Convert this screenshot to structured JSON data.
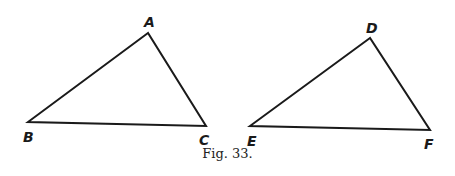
{
  "figure": {
    "caption": "Fig. 33.",
    "stroke_color": "#1a1a1a",
    "triangles": [
      {
        "name": "ABC",
        "vertices": [
          {
            "label": "A",
            "x": 148,
            "y": 33,
            "lx": 144,
            "ly": 27
          },
          {
            "label": "B",
            "x": 28,
            "y": 122,
            "lx": 23,
            "ly": 142
          },
          {
            "label": "C",
            "x": 206,
            "y": 126,
            "lx": 199,
            "ly": 145
          }
        ]
      },
      {
        "name": "DEF",
        "vertices": [
          {
            "label": "D",
            "x": 370,
            "y": 38,
            "lx": 366,
            "ly": 33
          },
          {
            "label": "E",
            "x": 250,
            "y": 126,
            "lx": 247,
            "ly": 146
          },
          {
            "label": "F",
            "x": 430,
            "y": 130,
            "lx": 424,
            "ly": 149
          }
        ]
      }
    ]
  }
}
